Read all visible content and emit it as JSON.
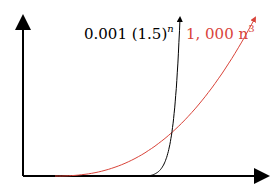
{
  "chart_data": {
    "type": "line",
    "title": "",
    "xlabel": "n",
    "ylabel": "",
    "grid": false,
    "legend": "inline-top",
    "series": [
      {
        "name": "0.001 (1.5)^n",
        "label_base": "0.001 (1.5)",
        "label_exp": "n",
        "color": "#000000",
        "kind": "exp"
      },
      {
        "name": "1,000 n^3",
        "label_base": "1, 000 n",
        "label_exp": "3",
        "color": "#d9443a",
        "kind": "cubic"
      }
    ],
    "crossing_note": "curves intersect near upper-right; exponential overtakes cubic"
  }
}
